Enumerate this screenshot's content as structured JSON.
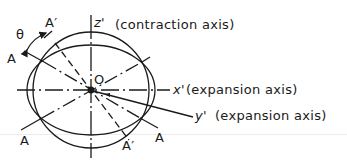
{
  "diagram": {
    "type": "strain ellipse diagram",
    "origin_label": "O",
    "angle_label": "θ",
    "axes": [
      {
        "name": "z'",
        "description": "(contraction axis)"
      },
      {
        "name": "x'",
        "description": "(expansion axis)"
      },
      {
        "name": "y'",
        "description": "(expansion axis)"
      }
    ],
    "line_labels": {
      "a_upper_left": "A",
      "a_lower_left": "A",
      "a_lower_right": "A",
      "a_prime_top": "A′",
      "a_prime_bottom": "A′"
    },
    "shapes": [
      {
        "kind": "circle",
        "role": "undeformed"
      },
      {
        "kind": "ellipse",
        "role": "deformed",
        "note": "elongated along x', shortened along z'"
      }
    ],
    "colors": {
      "stroke": "#1a1a1a",
      "background": "#ffffff"
    }
  }
}
